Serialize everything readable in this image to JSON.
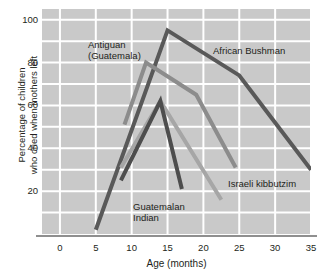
{
  "chart_data": {
    "type": "line",
    "title": "",
    "xlabel": "Age (months)",
    "ylabel": "Percentage of children who cried when mothers left",
    "ylabel_line1": "Percentage of children",
    "ylabel_line2": "who cried when mothers left",
    "xlim": [
      -2.5,
      35
    ],
    "ylim": [
      0,
      105
    ],
    "xticks": [
      0,
      5,
      10,
      15,
      20,
      25,
      30,
      35
    ],
    "yticks": [
      20,
      40,
      60,
      80,
      100
    ],
    "grid": true,
    "grid_color": "#ffffff",
    "plot_background": "#c9c9c9",
    "legend_position": "inline-annotations",
    "series": [
      {
        "name": "African Bushman",
        "color": "#595959",
        "x": [
          5,
          15,
          25,
          35
        ],
        "y": [
          2,
          95,
          74,
          30
        ]
      },
      {
        "name": "Antiguan (Guatemala)",
        "color": "#8c8c8c",
        "x": [
          9,
          12,
          19,
          24.5
        ],
        "y": [
          51,
          80,
          65,
          31
        ]
      },
      {
        "name": "Israeli kibbutzim",
        "color": "#a6a6a6",
        "x": [
          8.5,
          14,
          22.5
        ],
        "y": [
          31,
          62,
          16
        ]
      },
      {
        "name": "Guatemalan Indian",
        "color": "#4d4d4d",
        "x": [
          8.5,
          14,
          17
        ],
        "y": [
          25,
          62,
          21
        ]
      }
    ],
    "annotations": [
      {
        "key": "antiguan",
        "text_line1": "Antiguan",
        "text_line2": "(Guatemala)"
      },
      {
        "key": "bushman",
        "text_line1": "African Bushman",
        "text_line2": ""
      },
      {
        "key": "kibbutzim",
        "text_line1": "Israeli kibbutzim",
        "text_line2": ""
      },
      {
        "key": "guatemalan",
        "text_line1": "Guatemalan",
        "text_line2": "Indian"
      }
    ]
  }
}
